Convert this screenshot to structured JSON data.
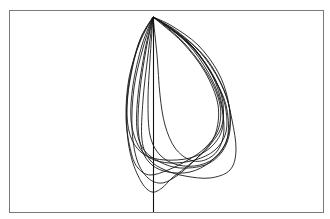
{
  "chart_data": {
    "type": "line",
    "title": "",
    "xlabel": "",
    "ylabel": "",
    "grid": false,
    "legend": null,
    "frame": {
      "x": 9,
      "y": 10,
      "width": 314,
      "height": 202,
      "stroke": "#7a7a7a"
    },
    "axis_line": {
      "x": 153,
      "y1": 17,
      "y2": 212,
      "stroke": "#111111"
    },
    "origin": {
      "x": 153,
      "y": 17
    },
    "line_color": "#1a1a1a",
    "loops": [
      {
        "points": [
          [
            153,
            17
          ],
          [
            140,
            40
          ],
          [
            130,
            80
          ],
          [
            127,
            115
          ],
          [
            132,
            140
          ],
          [
            145,
            155
          ],
          [
            165,
            160
          ],
          [
            190,
            158
          ],
          [
            210,
            148
          ],
          [
            222,
            130
          ],
          [
            222,
            105
          ],
          [
            212,
            75
          ],
          [
            190,
            45
          ],
          [
            165,
            25
          ],
          [
            153,
            17
          ]
        ]
      },
      {
        "points": [
          [
            153,
            17
          ],
          [
            142,
            45
          ],
          [
            133,
            85
          ],
          [
            131,
            120
          ],
          [
            138,
            145
          ],
          [
            150,
            158
          ],
          [
            170,
            163
          ],
          [
            195,
            160
          ],
          [
            215,
            150
          ],
          [
            226,
            132
          ],
          [
            225,
            105
          ],
          [
            214,
            78
          ],
          [
            195,
            50
          ],
          [
            170,
            28
          ],
          [
            153,
            17
          ]
        ]
      },
      {
        "points": [
          [
            153,
            17
          ],
          [
            145,
            50
          ],
          [
            138,
            95
          ],
          [
            137,
            130
          ],
          [
            144,
            150
          ],
          [
            160,
            162
          ],
          [
            180,
            168
          ],
          [
            205,
            165
          ],
          [
            222,
            152
          ],
          [
            230,
            130
          ],
          [
            228,
            100
          ],
          [
            218,
            72
          ],
          [
            198,
            45
          ],
          [
            172,
            26
          ],
          [
            153,
            17
          ]
        ]
      },
      {
        "points": [
          [
            153,
            17
          ],
          [
            148,
            55
          ],
          [
            143,
            100
          ],
          [
            142,
            140
          ],
          [
            150,
            160
          ],
          [
            165,
            170
          ],
          [
            185,
            176
          ],
          [
            210,
            178
          ],
          [
            230,
            170
          ],
          [
            236,
            150
          ],
          [
            232,
            120
          ],
          [
            224,
            90
          ],
          [
            206,
            58
          ],
          [
            178,
            32
          ],
          [
            153,
            17
          ]
        ]
      },
      {
        "points": [
          [
            153,
            17
          ],
          [
            140,
            42
          ],
          [
            129,
            78
          ],
          [
            126,
            118
          ],
          [
            131,
            152
          ],
          [
            138,
            168
          ],
          [
            150,
            175
          ],
          [
            168,
            170
          ],
          [
            188,
            160
          ],
          [
            205,
            148
          ],
          [
            218,
            130
          ],
          [
            220,
            105
          ],
          [
            208,
            75
          ],
          [
            186,
            45
          ],
          [
            164,
            25
          ],
          [
            153,
            17
          ]
        ]
      },
      {
        "points": [
          [
            153,
            17
          ],
          [
            138,
            45
          ],
          [
            128,
            90
          ],
          [
            127,
            130
          ],
          [
            132,
            160
          ],
          [
            142,
            183
          ],
          [
            152,
            192
          ],
          [
            162,
            188
          ],
          [
            172,
            178
          ],
          [
            185,
            168
          ],
          [
            200,
            155
          ],
          [
            215,
            135
          ],
          [
            218,
            105
          ],
          [
            205,
            72
          ],
          [
            182,
            42
          ],
          [
            153,
            17
          ]
        ]
      },
      {
        "points": [
          [
            153,
            17
          ],
          [
            150,
            60
          ],
          [
            148,
            100
          ],
          [
            150,
            135
          ],
          [
            160,
            155
          ],
          [
            178,
            165
          ],
          [
            200,
            165
          ],
          [
            218,
            155
          ],
          [
            228,
            135
          ],
          [
            226,
            105
          ],
          [
            214,
            78
          ],
          [
            194,
            48
          ],
          [
            170,
            28
          ],
          [
            153,
            17
          ]
        ]
      },
      {
        "points": [
          [
            153,
            17
          ],
          [
            146,
            50
          ],
          [
            140,
            90
          ],
          [
            138,
            125
          ],
          [
            142,
            150
          ],
          [
            152,
            165
          ],
          [
            168,
            172
          ],
          [
            190,
            172
          ],
          [
            210,
            162
          ],
          [
            226,
            142
          ],
          [
            230,
            112
          ],
          [
            220,
            82
          ],
          [
            200,
            52
          ],
          [
            174,
            30
          ],
          [
            153,
            17
          ]
        ]
      },
      {
        "points": [
          [
            153,
            17
          ],
          [
            157,
            55
          ],
          [
            160,
            95
          ],
          [
            165,
            125
          ],
          [
            175,
            148
          ],
          [
            190,
            160
          ],
          [
            205,
            160
          ],
          [
            218,
            150
          ],
          [
            224,
            130
          ],
          [
            220,
            100
          ],
          [
            208,
            72
          ],
          [
            188,
            44
          ],
          [
            165,
            25
          ],
          [
            153,
            17
          ]
        ]
      },
      {
        "points": [
          [
            153,
            17
          ],
          [
            143,
            48
          ],
          [
            134,
            88
          ],
          [
            132,
            128
          ],
          [
            137,
            160
          ],
          [
            148,
            178
          ],
          [
            162,
            183
          ],
          [
            178,
            175
          ],
          [
            195,
            160
          ],
          [
            210,
            145
          ],
          [
            222,
            125
          ],
          [
            222,
            98
          ],
          [
            210,
            70
          ],
          [
            188,
            42
          ],
          [
            163,
            23
          ],
          [
            153,
            17
          ]
        ]
      }
    ]
  }
}
